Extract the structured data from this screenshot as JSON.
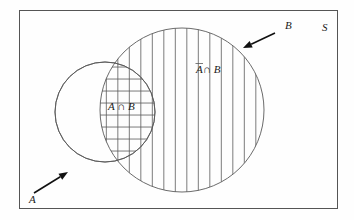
{
  "diagram": {
    "type": "venn-diagram",
    "title_visible": false,
    "universe": {
      "label": "S",
      "label_x": 322,
      "label_y": 31,
      "rect": {
        "x": 19,
        "y": 10,
        "width": 318,
        "height": 198
      }
    },
    "sets": [
      {
        "id": "A",
        "label": "A",
        "label_x": 29,
        "label_y": 203,
        "cx": 105,
        "cy": 112,
        "r": 50,
        "shading": "none"
      },
      {
        "id": "B",
        "label": "B",
        "label_x": 285,
        "label_y": 29,
        "cx": 182,
        "cy": 110,
        "r": 82,
        "shading": "vertical-hatch"
      }
    ],
    "regions": [
      {
        "id": "A-intersect-B",
        "label": "A ∩ B",
        "label_x": 108,
        "label_y": 110,
        "shading": "horizontal-hatch",
        "description": "lens where A and B overlap"
      },
      {
        "id": "notA-intersect-B",
        "label_prefix": "A",
        "label_suffix": " ∩ B",
        "label": "Ā ∩ B",
        "label_x": 196,
        "label_y": 73,
        "shading": "vertical-hatch",
        "description": "part of B outside A, A complement intersect B"
      }
    ],
    "annotations": [
      {
        "id": "arrow-to-A",
        "target_set": "A",
        "label": "A",
        "from_x": 34,
        "from_y": 193,
        "to_x": 68,
        "to_y": 172
      },
      {
        "id": "arrow-to-B",
        "target_set": "B",
        "label": "B",
        "from_x": 275,
        "from_y": 33,
        "to_x": 243,
        "to_y": 48
      }
    ],
    "hatching": {
      "vertical_spacing": 11.5,
      "horizontal_spacing": 12,
      "stroke_color": "#5a5a5a"
    },
    "colors": {
      "background": "#fefefe",
      "border": "#555555",
      "circle_stroke": "#5a5a5a",
      "hatch": "#5a5a5a",
      "arrow": "#111111",
      "text": "#1a1a1a"
    }
  }
}
